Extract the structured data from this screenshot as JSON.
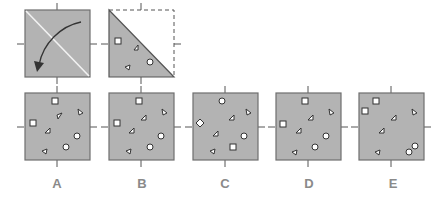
{
  "colors": {
    "fill": "#b3b3b3",
    "stroke": "#6e6e6e",
    "shape_fill": "#ffffff",
    "shape_stroke": "#333333",
    "label": "#8a8a8a"
  },
  "question": {
    "step1": {
      "description": "Square with diagonal fold line and curved arrow indicating folding top-right over to bottom-left"
    },
    "step2": {
      "description": "Folded triangle (lower-left half) with dashed outline of missing upper-right half",
      "shapes": [
        {
          "type": "square",
          "x": 0.15,
          "y": 0.48
        },
        {
          "type": "triangle",
          "x": 0.37,
          "y": 0.55
        },
        {
          "type": "triangle",
          "x": 0.28,
          "y": 0.86
        },
        {
          "type": "circle",
          "x": 0.62,
          "y": 0.78
        }
      ]
    }
  },
  "options": [
    {
      "label": "A",
      "shapes": [
        {
          "type": "square",
          "x": 0.48,
          "y": 0.12
        },
        {
          "type": "triangle",
          "x": 0.86,
          "y": 0.3
        },
        {
          "type": "triangle",
          "x": 0.52,
          "y": 0.37
        },
        {
          "type": "square",
          "x": 0.12,
          "y": 0.45
        },
        {
          "type": "triangle",
          "x": 0.37,
          "y": 0.55
        },
        {
          "type": "circle",
          "x": 0.8,
          "y": 0.63
        },
        {
          "type": "circle",
          "x": 0.63,
          "y": 0.8
        },
        {
          "type": "triangle",
          "x": 0.29,
          "y": 0.88
        }
      ]
    },
    {
      "label": "B",
      "shapes": [
        {
          "type": "square",
          "x": 0.48,
          "y": 0.12
        },
        {
          "type": "triangle",
          "x": 0.86,
          "y": 0.3
        },
        {
          "type": "triangle",
          "x": 0.52,
          "y": 0.37
        },
        {
          "type": "square",
          "x": 0.12,
          "y": 0.45
        },
        {
          "type": "triangle",
          "x": 0.37,
          "y": 0.55
        },
        {
          "type": "circle",
          "x": 0.8,
          "y": 0.63
        },
        {
          "type": "circle",
          "x": 0.63,
          "y": 0.8
        },
        {
          "type": "triangle",
          "x": 0.29,
          "y": 0.88
        }
      ]
    },
    {
      "label": "C",
      "shapes": [
        {
          "type": "circle",
          "x": 0.45,
          "y": 0.12
        },
        {
          "type": "triangle",
          "x": 0.86,
          "y": 0.3
        },
        {
          "type": "triangle",
          "x": 0.58,
          "y": 0.37
        },
        {
          "type": "diamond",
          "x": 0.12,
          "y": 0.45
        },
        {
          "type": "triangle",
          "x": 0.37,
          "y": 0.62
        },
        {
          "type": "circle",
          "x": 0.8,
          "y": 0.63
        },
        {
          "type": "square",
          "x": 0.63,
          "y": 0.8
        },
        {
          "type": "triangle",
          "x": 0.29,
          "y": 0.88
        }
      ]
    },
    {
      "label": "D",
      "shapes": [
        {
          "type": "square",
          "x": 0.48,
          "y": 0.12
        },
        {
          "type": "triangle",
          "x": 0.86,
          "y": 0.3
        },
        {
          "type": "triangle",
          "x": 0.55,
          "y": 0.37
        },
        {
          "type": "square",
          "x": 0.12,
          "y": 0.45
        },
        {
          "type": "triangle",
          "x": 0.37,
          "y": 0.55
        },
        {
          "type": "circle",
          "x": 0.8,
          "y": 0.63
        },
        {
          "type": "circle",
          "x": 0.63,
          "y": 0.8
        },
        {
          "type": "triangle",
          "x": 0.29,
          "y": 0.88
        }
      ]
    },
    {
      "label": "E",
      "shapes": [
        {
          "type": "square",
          "x": 0.3,
          "y": 0.12
        },
        {
          "type": "square",
          "x": 0.12,
          "y": 0.3
        },
        {
          "type": "triangle",
          "x": 0.86,
          "y": 0.3
        },
        {
          "type": "triangle",
          "x": 0.55,
          "y": 0.37
        },
        {
          "type": "triangle",
          "x": 0.37,
          "y": 0.55
        },
        {
          "type": "circle",
          "x": 0.88,
          "y": 0.8
        },
        {
          "type": "circle",
          "x": 0.8,
          "y": 0.88
        },
        {
          "type": "triangle",
          "x": 0.29,
          "y": 0.88
        }
      ]
    }
  ]
}
